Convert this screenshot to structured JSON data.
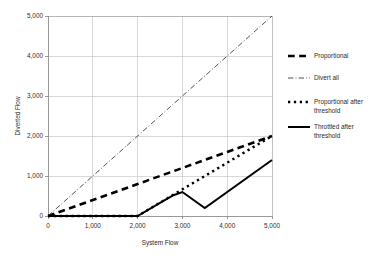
{
  "chart_data": {
    "type": "line",
    "title": "",
    "xlabel": "System Flow",
    "ylabel": "Diverted Flow",
    "xlim": [
      0,
      5000
    ],
    "ylim": [
      0,
      5000
    ],
    "grid": true,
    "legend_position": "right",
    "xticks": [
      "0",
      "1,000",
      "2,000",
      "3,000",
      "4,000",
      "5,000"
    ],
    "xtick_values": [
      0,
      1000,
      2000,
      3000,
      4000,
      5000
    ],
    "yticks": [
      "0",
      "1,000",
      "2,000",
      "3,000",
      "4,000",
      "5,000"
    ],
    "ytick_values": [
      0,
      1000,
      2000,
      3000,
      4000,
      5000
    ],
    "series": [
      {
        "name": "Proportional",
        "style": "dashed",
        "color": "#000000",
        "width": 2.6,
        "x": [
          0,
          1000,
          2000,
          3000,
          4000,
          4400,
          5000
        ],
        "values": [
          0,
          400,
          800,
          1200,
          1600,
          1760,
          2000
        ]
      },
      {
        "name": "Divert all",
        "style": "dash-dot",
        "color": "#404040",
        "width": 0.9,
        "x": [
          0,
          1000,
          2000,
          3000,
          4000,
          5000
        ],
        "values": [
          0,
          1000,
          2000,
          3000,
          4000,
          5000
        ]
      },
      {
        "name": "Proportional after threshold",
        "style": "dotted",
        "color": "#000000",
        "width": 2.4,
        "x": [
          0,
          2000,
          3000,
          4000,
          4400,
          5000
        ],
        "values": [
          0,
          0,
          667,
          1333,
          1600,
          2000
        ]
      },
      {
        "name": "Throttled after threshold",
        "style": "solid",
        "color": "#000000",
        "width": 2.0,
        "x": [
          0,
          2000,
          2500,
          2800,
          3000,
          3500,
          5000
        ],
        "values": [
          0,
          0,
          330,
          520,
          600,
          200,
          1400
        ]
      }
    ]
  },
  "legend": {
    "items": [
      {
        "label": "Proportional",
        "label_line2": ""
      },
      {
        "label": "Divert all",
        "label_line2": ""
      },
      {
        "label": "Proportional after",
        "label_line2": "threshold"
      },
      {
        "label": "Throttled after",
        "label_line2": "threshold"
      }
    ]
  }
}
